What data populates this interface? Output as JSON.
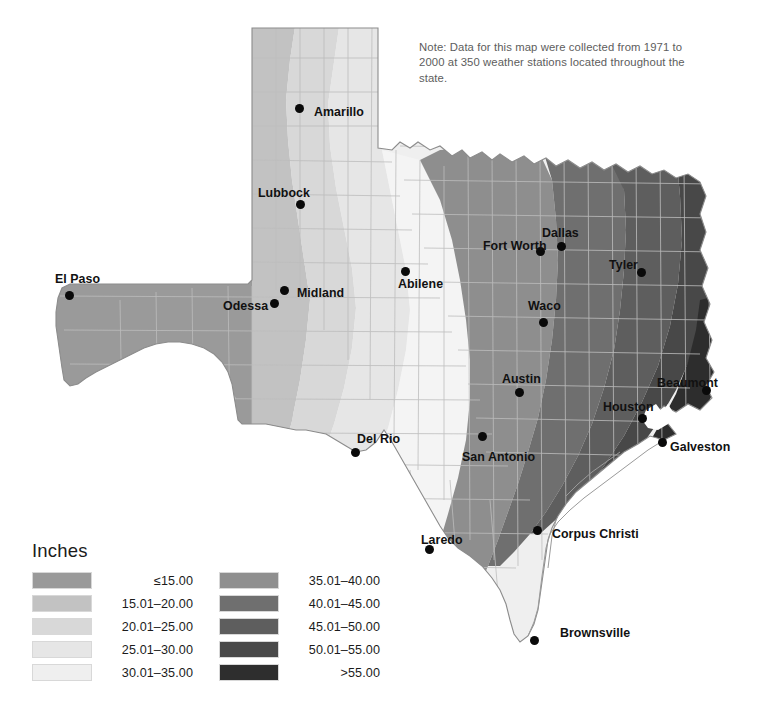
{
  "map": {
    "title": "Texas Average Annual Precipitation",
    "note": "Note: Data for this map were collected from 1971 to 2000 at 350 weather stations located throughout the state.",
    "background_color": "#ffffff",
    "county_line_color": "#bdbdbd",
    "state_outline_color": "#8c8c8c",
    "marker_color": "#0a0a0a"
  },
  "legend": {
    "title": "Inches",
    "column1": [
      {
        "label": "≤15.00",
        "color": "#9a9a9a"
      },
      {
        "label": "15.01–20.00",
        "color": "#c2c2c2"
      },
      {
        "label": "20.01–25.00",
        "color": "#d8d8d8"
      },
      {
        "label": "25.01–30.00",
        "color": "#e6e6e6"
      },
      {
        "label": "30.01–35.00",
        "color": "#efefef"
      }
    ],
    "column2": [
      {
        "label": "35.01–40.00",
        "color": "#8f8f8f"
      },
      {
        "label": "40.01–45.00",
        "color": "#6f6f6f"
      },
      {
        "label": "45.01–50.00",
        "color": "#5e5e5e"
      },
      {
        "label": "50.01–55.00",
        "color": "#494949"
      },
      {
        "label": ">55.00",
        "color": "#2e2e2e"
      }
    ]
  },
  "cities": [
    {
      "name": "Amarillo",
      "label_x": 314,
      "label_y": 105,
      "dot_x": 299,
      "dot_y": 108
    },
    {
      "name": "Lubbock",
      "label_x": 258,
      "label_y": 186,
      "dot_x": 300,
      "dot_y": 204
    },
    {
      "name": "El Paso",
      "label_x": 55,
      "label_y": 272,
      "dot_x": 69,
      "dot_y": 295
    },
    {
      "name": "Odessa",
      "label_x": 223,
      "label_y": 299,
      "dot_x": 274,
      "dot_y": 303
    },
    {
      "name": "Midland",
      "label_x": 297,
      "label_y": 286,
      "dot_x": 284,
      "dot_y": 290
    },
    {
      "name": "Abilene",
      "label_x": 398,
      "label_y": 277,
      "dot_x": 405,
      "dot_y": 271
    },
    {
      "name": "Fort Worth",
      "label_x": 483,
      "label_y": 239,
      "dot_x": 540,
      "dot_y": 251
    },
    {
      "name": "Dallas",
      "label_x": 542,
      "label_y": 226,
      "dot_x": 561,
      "dot_y": 246
    },
    {
      "name": "Tyler",
      "label_x": 609,
      "label_y": 258,
      "dot_x": 641,
      "dot_y": 272
    },
    {
      "name": "Waco",
      "label_x": 528,
      "label_y": 299,
      "dot_x": 543,
      "dot_y": 322
    },
    {
      "name": "Austin",
      "label_x": 502,
      "label_y": 372,
      "dot_x": 519,
      "dot_y": 392
    },
    {
      "name": "San Antonio",
      "label_x": 462,
      "label_y": 450,
      "dot_x": 482,
      "dot_y": 436
    },
    {
      "name": "Del Rio",
      "label_x": 357,
      "label_y": 432,
      "dot_x": 355,
      "dot_y": 452
    },
    {
      "name": "Laredo",
      "label_x": 421,
      "label_y": 533,
      "dot_x": 429,
      "dot_y": 549
    },
    {
      "name": "Corpus Christi",
      "label_x": 552,
      "label_y": 527,
      "dot_x": 537,
      "dot_y": 530
    },
    {
      "name": "Houston",
      "label_x": 603,
      "label_y": 400,
      "dot_x": 642,
      "dot_y": 418
    },
    {
      "name": "Beaumont",
      "label_x": 657,
      "label_y": 376,
      "dot_x": 706,
      "dot_y": 390
    },
    {
      "name": "Galveston",
      "label_x": 670,
      "label_y": 440,
      "dot_x": 662,
      "dot_y": 442
    },
    {
      "name": "Brownsville",
      "label_x": 560,
      "label_y": 626,
      "dot_x": 534,
      "dot_y": 640
    }
  ],
  "chart_data": {
    "type": "heatmap",
    "unit": "inches",
    "legend_position": "bottom-left",
    "bands": [
      {
        "range": "≤15.00",
        "min": 0,
        "max": 15,
        "color": "#9a9a9a",
        "region": "far west / El Paso and Trans-Pecos"
      },
      {
        "range": "15.01–20.00",
        "min": 15.01,
        "max": 20,
        "color": "#c2c2c2",
        "region": "western panhandle, Lubbock, Odessa"
      },
      {
        "range": "20.01–25.00",
        "min": 20.01,
        "max": 25,
        "color": "#d8d8d8",
        "region": "eastern panhandle, Midland"
      },
      {
        "range": "25.01–30.00",
        "min": 25.01,
        "max": 30,
        "color": "#e6e6e6",
        "region": "Abilene and west-central Texas"
      },
      {
        "range": "30.01–35.00",
        "min": 30.01,
        "max": 35,
        "color": "#efefef",
        "region": "central Texas, Hill Country, Laredo"
      },
      {
        "range": "35.01–40.00",
        "min": 35.01,
        "max": 40,
        "color": "#8f8f8f",
        "region": "Dallas–Fort Worth, Waco, Austin, Corpus Christi"
      },
      {
        "range": "40.01–45.00",
        "min": 40.01,
        "max": 45,
        "color": "#6f6f6f",
        "region": "east central Texas, Houston, Tyler"
      },
      {
        "range": "45.01–50.00",
        "min": 45.01,
        "max": 50,
        "color": "#5e5e5e",
        "region": "east Texas piney woods"
      },
      {
        "range": "50.01–55.00",
        "min": 50.01,
        "max": 55,
        "color": "#494949",
        "region": "far east Texas, Beaumont"
      },
      {
        "range": ">55.00",
        "min": 55.01,
        "max": null,
        "color": "#2e2e2e",
        "region": "southeast corner near Louisiana border"
      }
    ],
    "gradient_direction": "west (driest) to east (wettest)"
  }
}
